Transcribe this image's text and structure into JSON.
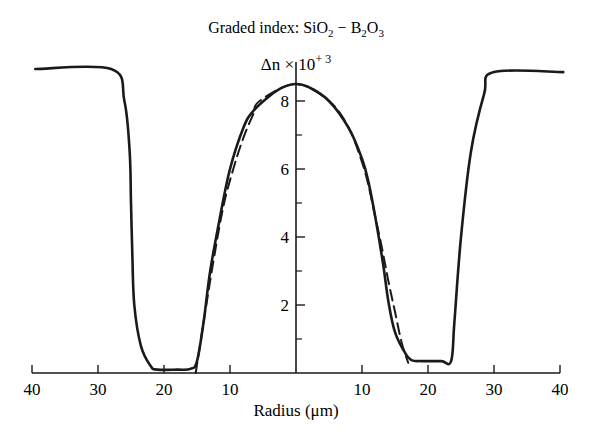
{
  "chart_data": {
    "type": "line",
    "title": "Graded index:  SiO2 − B2O3",
    "title_parts": {
      "prefix": "Graded index:  SiO",
      "sub1": "2",
      "mid": " − B",
      "sub2": "2",
      "mid2": "O",
      "sub3": "3"
    },
    "ylabel": "Δn × 10+3",
    "ylabel_parts": {
      "base": "Δn × 10",
      "sup": "+ 3"
    },
    "xlabel": "Radius (μm)",
    "x_ticks": [
      {
        "value": -40,
        "label": "40"
      },
      {
        "value": -30,
        "label": "30"
      },
      {
        "value": -20,
        "label": "20"
      },
      {
        "value": -10,
        "label": "10"
      },
      {
        "value": 10,
        "label": "10"
      },
      {
        "value": 20,
        "label": "20"
      },
      {
        "value": 30,
        "label": "30"
      },
      {
        "value": 40,
        "label": "40"
      }
    ],
    "y_ticks": [
      {
        "value": 2,
        "label": "2"
      },
      {
        "value": 4,
        "label": "4"
      },
      {
        "value": 6,
        "label": "6"
      },
      {
        "value": 8,
        "label": "8"
      }
    ],
    "y_minor_ticks": [
      1,
      3,
      5,
      7
    ],
    "xlim": [
      -40,
      40
    ],
    "ylim": [
      0,
      9
    ],
    "grid": false,
    "legend": null,
    "series": [
      {
        "name": "measured profile",
        "style": "solid",
        "x": [
          -39.5,
          -28,
          -26,
          -25.2,
          -25,
          -24.8,
          -24.5,
          -23.5,
          -22,
          -21,
          -18,
          -16,
          -15,
          -14,
          -13,
          -11.5,
          -10,
          -8,
          -6.5,
          -4,
          -2,
          0,
          2,
          5,
          8,
          10,
          11,
          12,
          13.2,
          14,
          15,
          16.5,
          17.5,
          19,
          22,
          23.5,
          24,
          25,
          26.5,
          28.5,
          30,
          40.5
        ],
        "y": [
          8.94,
          8.94,
          8.0,
          6.5,
          5.0,
          3.5,
          2.0,
          0.8,
          0.2,
          0.1,
          0.1,
          0.12,
          0.35,
          1.5,
          3.0,
          4.6,
          6.0,
          7.2,
          7.7,
          8.15,
          8.4,
          8.5,
          8.4,
          8.0,
          7.2,
          6.3,
          5.6,
          4.6,
          3.2,
          2.1,
          1.2,
          0.6,
          0.38,
          0.35,
          0.35,
          0.35,
          1.5,
          4.0,
          6.5,
          8.2,
          8.85,
          8.85
        ]
      },
      {
        "name": "fitted profile",
        "style": "dashed",
        "x": [
          -15.2,
          -14,
          -12.5,
          -11,
          -9.5,
          -8,
          -6.5,
          -5.5,
          0,
          5,
          8,
          10,
          11,
          12,
          13,
          14,
          15,
          16,
          17
        ],
        "y": [
          0.0,
          1.5,
          3.3,
          4.9,
          6.0,
          6.9,
          7.6,
          8.0,
          8.5,
          8.0,
          7.2,
          6.2,
          5.5,
          4.6,
          3.7,
          2.7,
          1.8,
          0.9,
          0.3
        ]
      }
    ]
  }
}
